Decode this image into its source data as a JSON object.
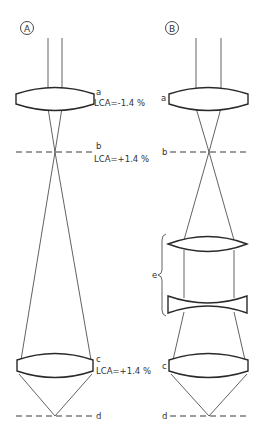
{
  "panels": [
    {
      "id": "A",
      "label": "A",
      "labels": {
        "a": "a",
        "b": "b",
        "c": "c",
        "d": "d"
      },
      "lca": {
        "a": "LCA=-1.4 %",
        "b": "LCA=+1.4 %",
        "c": "LCA=+1.4 %"
      }
    },
    {
      "id": "B",
      "label": "B",
      "labels": {
        "a": "a",
        "b": "b",
        "c": "c",
        "d": "d",
        "e": "e"
      }
    }
  ],
  "colors": {
    "line": "#3a3a3a",
    "background": "#ffffff"
  }
}
